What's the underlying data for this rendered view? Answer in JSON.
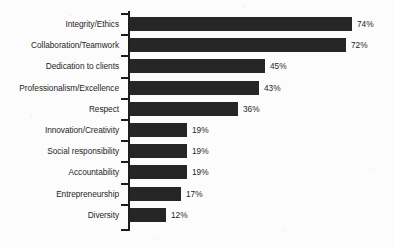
{
  "chart_data": {
    "type": "bar",
    "orientation": "horizontal",
    "title": "",
    "xlabel": "",
    "ylabel": "",
    "grid": false,
    "legend": false,
    "xlim": [
      0,
      80
    ],
    "value_suffix": "%",
    "categories": [
      "Integrity/Ethics",
      "Collaboration/Teamwork",
      "Dedication to clients",
      "Professionalism/Excellence",
      "Respect",
      "Innovation/Creativity",
      "Social responsibility",
      "Accountability",
      "Entrepreneurship",
      "Diversity"
    ],
    "values": [
      74,
      72,
      45,
      43,
      36,
      19,
      19,
      19,
      17,
      12
    ],
    "value_labels": [
      "74%",
      "72%",
      "45%",
      "43%",
      "36%",
      "19%",
      "19%",
      "19%",
      "17%",
      "12%"
    ],
    "bars": [
      {
        "category": "Integrity/Ethics",
        "value": 74,
        "label": "74%"
      },
      {
        "category": "Collaboration/Teamwork",
        "value": 72,
        "label": "72%"
      },
      {
        "category": "Dedication to clients",
        "value": 45,
        "label": "45%"
      },
      {
        "category": "Professionalism/Excellence",
        "value": 43,
        "label": "43%"
      },
      {
        "category": "Respect",
        "value": 36,
        "label": "36%"
      },
      {
        "category": "Innovation/Creativity",
        "value": 19,
        "label": "19%"
      },
      {
        "category": "Social responsibility",
        "value": 19,
        "label": "19%"
      },
      {
        "category": "Accountability",
        "value": 19,
        "label": "19%"
      },
      {
        "category": "Entrepreneurship",
        "value": 17,
        "label": "17%"
      },
      {
        "category": "Diversity",
        "value": 12,
        "label": "12%"
      }
    ]
  },
  "style": {
    "bar_color": "#262626",
    "axis_color": "#1d1d1d",
    "text_color": "#1f1f1f",
    "background": "#fcfcfc"
  }
}
